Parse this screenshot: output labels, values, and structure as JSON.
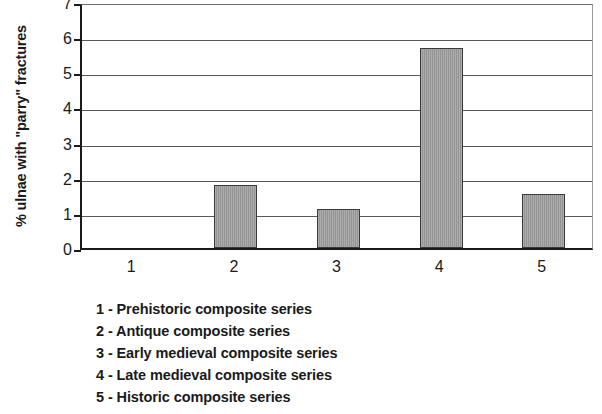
{
  "chart_data": {
    "type": "bar",
    "title": "",
    "xlabel": "",
    "ylabel": "% ulnae with \"parry\" fractures",
    "categories": [
      "1",
      "2",
      "3",
      "4",
      "5"
    ],
    "values": [
      0,
      1.8,
      1.1,
      5.7,
      1.55
    ],
    "ylim": [
      0,
      7
    ],
    "y_ticks": [
      "7",
      "6",
      "5",
      "4",
      "3",
      "2",
      "1",
      "0"
    ],
    "y_tick_values": [
      7,
      6,
      5,
      4,
      3,
      2,
      1,
      0
    ],
    "grid": true,
    "legend_position": "below-plot",
    "series": [
      {
        "name": "% ulnae with \"parry\" fractures",
        "color": "#9c9c9c",
        "values": [
          0,
          1.8,
          1.1,
          5.7,
          1.55
        ]
      }
    ],
    "annotations": [
      "1 - Prehistoric composite series",
      "2 - Antique composite series",
      "3 - Early medieval composite series",
      "4 - Late medieval composite series",
      "5 - Historic composite series"
    ]
  },
  "legend": {
    "entries": [
      {
        "text": "1 - Prehistoric composite series"
      },
      {
        "text": "2 - Antique composite series"
      },
      {
        "text": "3 - Early medieval composite series"
      },
      {
        "text": "4 - Late medieval composite series"
      },
      {
        "text": "5 - Historic composite series"
      }
    ]
  },
  "colors": {
    "bar_fill": "#9c9c9c",
    "bar_border": "#3a3a3a",
    "axis": "#1a1a1a",
    "gridline": "#585858",
    "background": "#ffffff"
  }
}
